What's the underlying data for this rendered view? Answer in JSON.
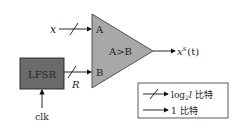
{
  "diagram": {
    "inputs": {
      "x_label": "x",
      "r_label": "R",
      "clk_label": "clk"
    },
    "lfsr": {
      "label": "LFSR",
      "fill": "#6b6b6b"
    },
    "comparator": {
      "port_a": "A",
      "port_b": "B",
      "label": "A>B",
      "fill": "#a8a8a8"
    },
    "output": {
      "label_base": "x",
      "label_sup": "s",
      "label_arg": "(t)"
    },
    "legend": {
      "bus_label_prefix": "log",
      "bus_label_sub": "2",
      "bus_label_var": "l",
      "bus_label_suffix": " 比特",
      "single_label": "1 比特"
    }
  }
}
